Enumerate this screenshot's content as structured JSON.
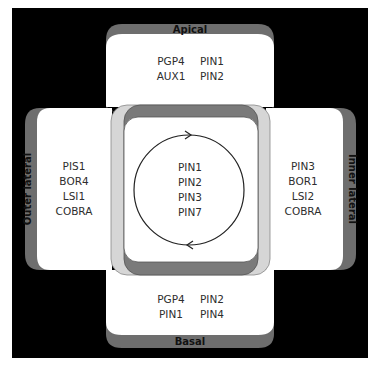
{
  "diagram": {
    "colors": {
      "background": "#000000",
      "membrane_band": "#6e6e6e",
      "cell_fill": "#ffffff",
      "outer_frame": "#d6d6d6",
      "inner_ring": "#7a7a7a",
      "text": "#2e2e2e"
    },
    "apical": {
      "label": "Apical",
      "proteins": [
        "PGP4",
        "PIN1",
        "AUX1",
        "PIN2"
      ]
    },
    "basal": {
      "label": "Basal",
      "proteins": [
        "PGP4",
        "PIN2",
        "PIN1",
        "PIN4"
      ]
    },
    "outer_lateral": {
      "label": "Outer lateral",
      "proteins": [
        "PIS1",
        "BOR4",
        "LSI1",
        "COBRA"
      ]
    },
    "inner_lateral": {
      "label": "Inner lateral",
      "proteins": [
        "PIN3",
        "BOR1",
        "LSI2",
        "COBRA"
      ]
    },
    "center": {
      "proteins": [
        "PIN1",
        "PIN2",
        "PIN3",
        "PIN7"
      ],
      "cycle_arrows": "clockwise-recycling"
    }
  }
}
